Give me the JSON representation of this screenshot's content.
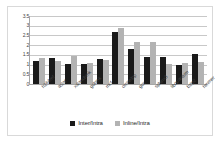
{
  "chart_data": {
    "type": "bar",
    "title": "",
    "subtitle": "",
    "xlabel": "",
    "ylabel": "",
    "ylim": [
      0,
      3.5
    ],
    "ytick_step": 0.5,
    "yticks": [
      "3.5",
      "3",
      "2.5",
      "2",
      "1.5",
      "1",
      "0.5",
      "0"
    ],
    "ytick_values": [
      3.5,
      3,
      2.5,
      2,
      1.5,
      1,
      0.5,
      0
    ],
    "grid": true,
    "grid_axis": "y",
    "legend_position": "bottom",
    "categories": [
      "h264ref",
      "astar",
      "xalancbmk",
      "gobmk",
      "mcf",
      "omnetpp",
      "gcc",
      "sphinx3",
      "libquantum",
      "bzip2",
      "hmmer"
    ],
    "series": [
      {
        "name": "Inter/Intra",
        "color": "#1a1a1a",
        "values": [
          1.18,
          1.35,
          1.02,
          1.02,
          1.28,
          2.7,
          1.8,
          1.38,
          1.38,
          0.98,
          1.55
        ]
      },
      {
        "name": "Inline/Intra",
        "color": "#b3b3b3",
        "values": [
          1.32,
          1.18,
          1.42,
          1.1,
          1.25,
          2.9,
          2.18,
          2.15,
          1.02,
          1.07,
          1.15
        ]
      }
    ]
  },
  "legend": {
    "items": [
      {
        "label": "Inter/Intra",
        "swatch": "dark-square-swatch"
      },
      {
        "label": "Inline/Intra",
        "swatch": "light-square-swatch"
      }
    ]
  }
}
